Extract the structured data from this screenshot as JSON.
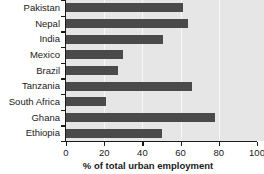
{
  "chart_data": {
    "type": "bar",
    "orientation": "horizontal",
    "title": "",
    "xlabel": "% of total urban employment",
    "ylabel": "",
    "xlim": [
      0,
      100
    ],
    "xticks": [
      0,
      20,
      40,
      60,
      80,
      100
    ],
    "grid": true,
    "legend": null,
    "categories": [
      "Pakistan",
      "Nepal",
      "India",
      "Mexico",
      "Brazil",
      "Tanzania",
      "South Africa",
      "Ghana",
      "Ethiopia"
    ],
    "values": [
      61,
      64,
      51,
      30,
      27,
      66,
      21,
      78,
      50
    ]
  },
  "style": {
    "bar_color": "#4a4a4a",
    "plot_background": "#e6e6e6",
    "gridline_color": "#f7f7f7",
    "axis_color": "#1a1a1a",
    "page_background": "#ffffff"
  }
}
